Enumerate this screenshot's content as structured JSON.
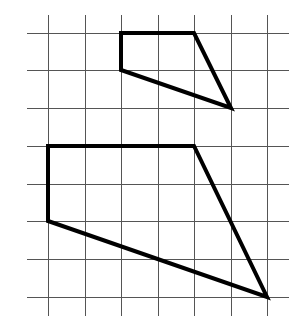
{
  "diagram": {
    "type": "grid-figures",
    "canvas": {
      "width": 308,
      "height": 332
    },
    "colors": {
      "background": "#ffffff",
      "grid": "#555555",
      "shape": "#000000"
    },
    "grid": {
      "columns_x": [
        48,
        85,
        121,
        158,
        194,
        231,
        267
      ],
      "rows_y": [
        33,
        70,
        108,
        146,
        184,
        221,
        259,
        297
      ],
      "horizontal_extent": [
        27,
        289
      ],
      "vertical_extent": [
        15,
        316
      ],
      "cell_size_px": 37
    },
    "shapes": [
      {
        "name": "small-quadrilateral",
        "grid_vertices": [
          [
            2,
            0
          ],
          [
            4,
            0
          ],
          [
            5,
            2
          ],
          [
            2,
            1
          ]
        ],
        "points": [
          [
            121,
            33
          ],
          [
            194,
            33
          ],
          [
            231,
            108
          ],
          [
            121,
            70
          ]
        ]
      },
      {
        "name": "large-quadrilateral",
        "grid_vertices": [
          [
            0,
            3
          ],
          [
            4,
            3
          ],
          [
            6,
            7
          ],
          [
            0,
            5
          ]
        ],
        "points": [
          [
            48,
            146
          ],
          [
            194,
            146
          ],
          [
            267,
            297
          ],
          [
            48,
            221
          ]
        ]
      }
    ]
  }
}
